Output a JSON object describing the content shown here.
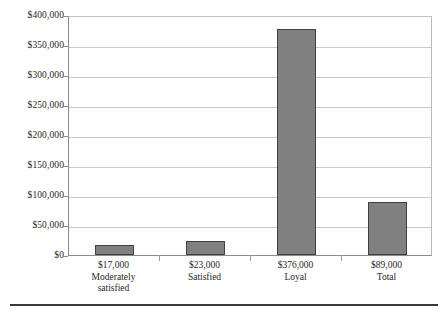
{
  "chart_data": {
    "type": "bar",
    "title": "",
    "subtitle": "",
    "xlabel": "",
    "ylabel": "",
    "categories": [
      "Moderately satisfied",
      "Satisfied",
      "Loyal",
      "Total"
    ],
    "values": [
      17000,
      23000,
      376000,
      89000
    ],
    "value_labels": [
      "$17,000",
      "$23,000",
      "$376,000",
      "$89,000"
    ],
    "category_lines": [
      [
        "Moderately",
        "satisfied"
      ],
      [
        "Satisfied"
      ],
      [
        "Loyal"
      ],
      [
        "Total"
      ]
    ],
    "ylim": [
      0,
      400000
    ],
    "ytick_values": [
      0,
      50000,
      100000,
      150000,
      200000,
      250000,
      300000,
      350000,
      400000
    ],
    "ytick_labels": [
      "$0",
      "$50,000",
      "$100,000",
      "$150,000",
      "$200,000",
      "$250,000",
      "$300,000",
      "$350,000",
      "$400,000"
    ],
    "grid": true,
    "grid_axis": "y",
    "legend": null,
    "legend_position": "none",
    "bar_fill_color": "#808080",
    "bar_border_color": "#404040",
    "gridline_color": "#c9c9c9",
    "axis_color": "#8a8a8a",
    "background_color": "#ffffff"
  }
}
